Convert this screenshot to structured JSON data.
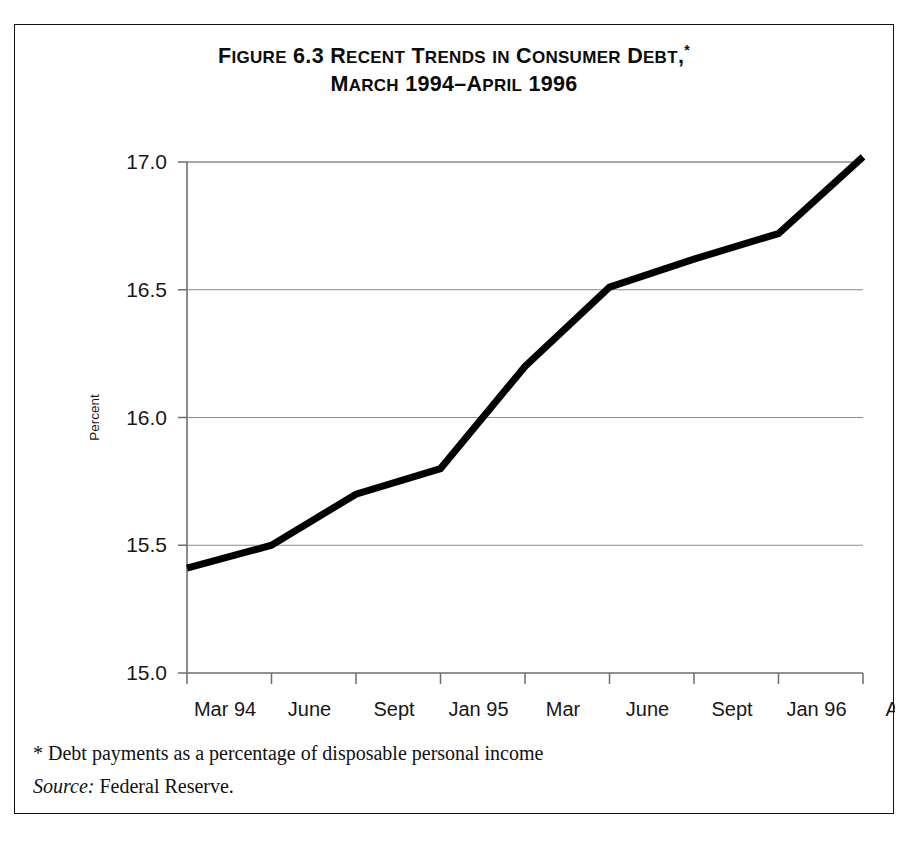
{
  "figure": {
    "title_line1_segments": [
      {
        "text": "F",
        "case": "upper"
      },
      {
        "text": "IGURE",
        "case": "small"
      },
      {
        "text": " 6.3 R",
        "case": "upper"
      },
      {
        "text": "ECENT",
        "case": "small"
      },
      {
        "text": " T",
        "case": "upper"
      },
      {
        "text": "RENDS",
        "case": "small"
      },
      {
        "text": " ",
        "case": "upper"
      },
      {
        "text": "IN",
        "case": "small"
      },
      {
        "text": " C",
        "case": "upper"
      },
      {
        "text": "ONSUMER",
        "case": "small"
      },
      {
        "text": " D",
        "case": "upper"
      },
      {
        "text": "EBT",
        "case": "small"
      },
      {
        "text": ",",
        "case": "upper"
      }
    ],
    "title_line1_plain": "FIGURE 6.3 RECENT TRENDS IN CONSUMER DEBT,",
    "title_star": "*",
    "title_line2_segments": [
      {
        "text": "M",
        "case": "upper"
      },
      {
        "text": "ARCH",
        "case": "small"
      },
      {
        "text": " 1994–A",
        "case": "upper"
      },
      {
        "text": "PRIL",
        "case": "small"
      },
      {
        "text": " 1996",
        "case": "upper"
      }
    ],
    "title_line2_plain": "MARCH 1994–APRIL 1996",
    "footnote": "* Debt payments as a percentage of disposable personal income",
    "source_label": "Source:",
    "source_value": "Federal Reserve."
  },
  "chart_data": {
    "type": "line",
    "xlabel": "",
    "ylabel": "Percent",
    "categories": [
      "Mar 94",
      "June",
      "Sept",
      "Jan 95",
      "Mar",
      "June",
      "Sept",
      "Jan 96",
      "Apr"
    ],
    "values": [
      15.41,
      15.5,
      15.7,
      15.8,
      16.2,
      16.51,
      16.62,
      16.72,
      17.02
    ],
    "ylim": [
      15.0,
      17.0
    ],
    "y_ticks": [
      "15.0",
      "15.5",
      "16.0",
      "16.5",
      "17.0"
    ],
    "y_tick_values": [
      15.0,
      15.5,
      16.0,
      16.5,
      17.0
    ],
    "grid": true,
    "legend": "none",
    "line_color": "#000000",
    "line_width": 7,
    "axis_color": "#6e6e6e",
    "grid_color": "#8d8d8d",
    "annotations": [
      "* Debt payments as a percentage of disposable personal income",
      "Source: Federal Reserve."
    ]
  }
}
